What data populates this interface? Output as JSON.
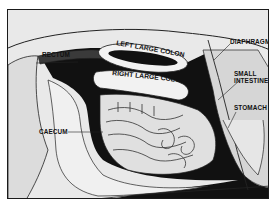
{
  "diagram": {
    "labels": {
      "rectum": "RECTUM",
      "left_large_colon": "LEFT LARGE COLON",
      "right_large_colon": "RIGHT LARGE COLON",
      "diaphragm": "DIAPHRAGM",
      "small_intestine_line1": "SMALL",
      "small_intestine_line2": "INTESTINE",
      "stomach": "STOMACH",
      "caecum": "CAECUM"
    },
    "colors": {
      "background": "#e9e9e9",
      "body_cavity": "#111111",
      "organ_fill": "#f2f2f2",
      "organ_shade": "#cfcfcf",
      "outline": "#1a1a1a"
    }
  }
}
